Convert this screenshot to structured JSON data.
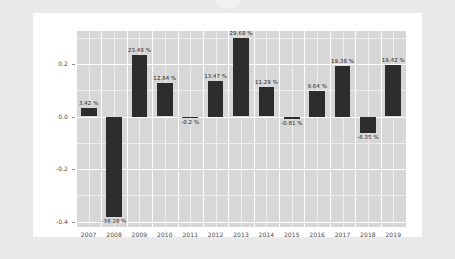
{
  "page": {
    "background_color": "#e9e9e9",
    "card_background_color": "#ffffff"
  },
  "chart_data": {
    "type": "bar",
    "title": "",
    "subtitle": "",
    "xlabel": "",
    "ylabel": "",
    "categories": [
      "2007",
      "2008",
      "2009",
      "2010",
      "2011",
      "2012",
      "2013",
      "2014",
      "2015",
      "2016",
      "2017",
      "2018",
      "2019"
    ],
    "values": [
      0.0342,
      -0.3828,
      0.2349,
      0.1284,
      -0.002,
      0.1347,
      0.2968,
      0.1129,
      -0.0081,
      0.0964,
      0.1938,
      -0.0635,
      0.1942
    ],
    "data_labels": [
      "3.42 %",
      "-38.28 %",
      "23.49 %",
      "12.84 %",
      "-0.2 %",
      "13.47 %",
      "29.68 %",
      "11.29 %",
      "-0.81 %",
      "9.64 %",
      "19.38 %",
      "-6.35 %",
      "19.42 %"
    ],
    "ytick_labels": [
      "0.2",
      "0.0",
      "-0.2",
      "-0.4"
    ],
    "ytick_values": [
      0.2,
      0.0,
      -0.2,
      -0.4
    ],
    "ylim": [
      -0.42,
      0.325
    ],
    "grid": true,
    "legend": null,
    "bar_color": "#2d2d2d",
    "plot_background_color": "#d7d7d7",
    "gridline_color": "#ffffff"
  }
}
